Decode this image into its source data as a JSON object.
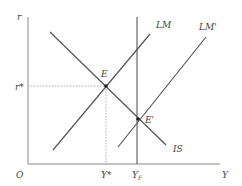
{
  "diagram": {
    "axes": {
      "y_label": "r",
      "x_label": "Y",
      "origin_label": "O"
    },
    "curves": {
      "is": "IS",
      "lm": "LM",
      "lm_prime": "LM'"
    },
    "points": {
      "e": "E",
      "e_prime": "E'"
    },
    "ticks": {
      "r_star": "r*",
      "y_star": "Y*",
      "y_f": "YF"
    },
    "colors": {
      "line": "#555555",
      "axis": "#888888",
      "dotted": "#999999"
    }
  }
}
